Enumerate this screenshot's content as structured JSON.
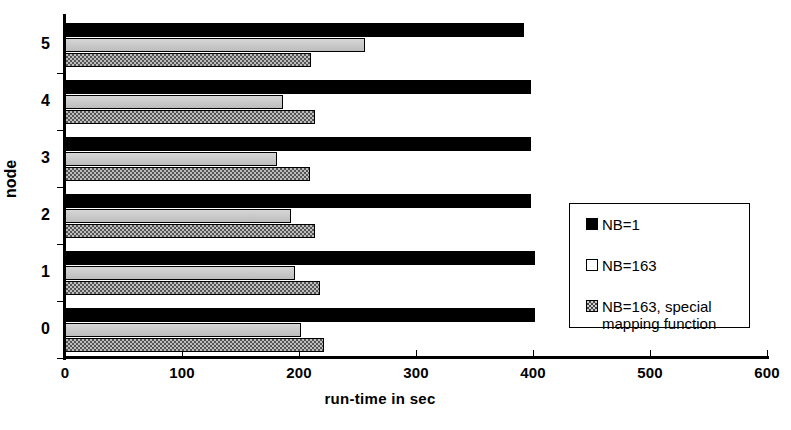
{
  "chart_data": {
    "type": "bar",
    "orientation": "horizontal",
    "title": "",
    "xlabel": "run-time in sec",
    "ylabel": "node",
    "categories": [
      "0",
      "1",
      "2",
      "3",
      "4",
      "5"
    ],
    "xlim": [
      0,
      600
    ],
    "xticks": [
      0,
      100,
      200,
      300,
      400,
      500,
      600
    ],
    "xticklabels": [
      "0",
      "100",
      "200",
      "300",
      "400",
      "500",
      "600"
    ],
    "grid": false,
    "legend_position": "center-right",
    "series": [
      {
        "name": "NB=1",
        "color": "#000000",
        "fill": "solid",
        "values": [
          402,
          402,
          398,
          398,
          398,
          392
        ]
      },
      {
        "name": "NB=163",
        "color": "#c8c8c8",
        "fill": "light-gray",
        "values": [
          202,
          197,
          193,
          181,
          186,
          256
        ]
      },
      {
        "name": "NB=163, special\nmapping function",
        "color": "#bdbdbd",
        "fill": "checkered",
        "values": [
          221,
          218,
          214,
          209,
          214,
          210
        ]
      }
    ]
  },
  "axis": {
    "x_title": "run-time in sec",
    "y_title": "node",
    "x_tick_labels": [
      "0",
      "100",
      "200",
      "300",
      "400",
      "500",
      "600"
    ],
    "y_tick_labels": [
      "5",
      "4",
      "3",
      "2",
      "1",
      "0"
    ]
  },
  "legend": {
    "entries": [
      {
        "label": "NB=1"
      },
      {
        "label": "NB=163"
      },
      {
        "label": "NB=163, special\nmapping function"
      }
    ]
  }
}
